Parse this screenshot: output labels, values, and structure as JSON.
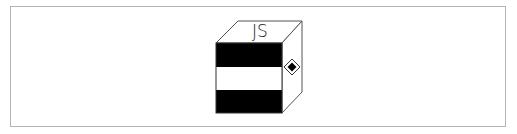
{
  "diagram": {
    "label": "JS",
    "colors": {
      "frame_border": "#b5b5b5",
      "cube_stroke": "#555555",
      "band_dark": "#000000",
      "band_light": "#ffffff",
      "label": "#222222",
      "marker": "#000000"
    },
    "cube": {
      "front_face": {
        "x": 216,
        "y": 43,
        "width": 66,
        "height": 70
      },
      "depth_offset": {
        "dx": 20,
        "dy": -22
      },
      "bands": [
        {
          "name": "top-band",
          "fill": "dark"
        },
        {
          "name": "middle-band",
          "fill": "light"
        },
        {
          "name": "bottom-band",
          "fill": "dark"
        }
      ]
    },
    "side_marker": {
      "shape": "diamond",
      "center": [
        292,
        67
      ]
    }
  }
}
